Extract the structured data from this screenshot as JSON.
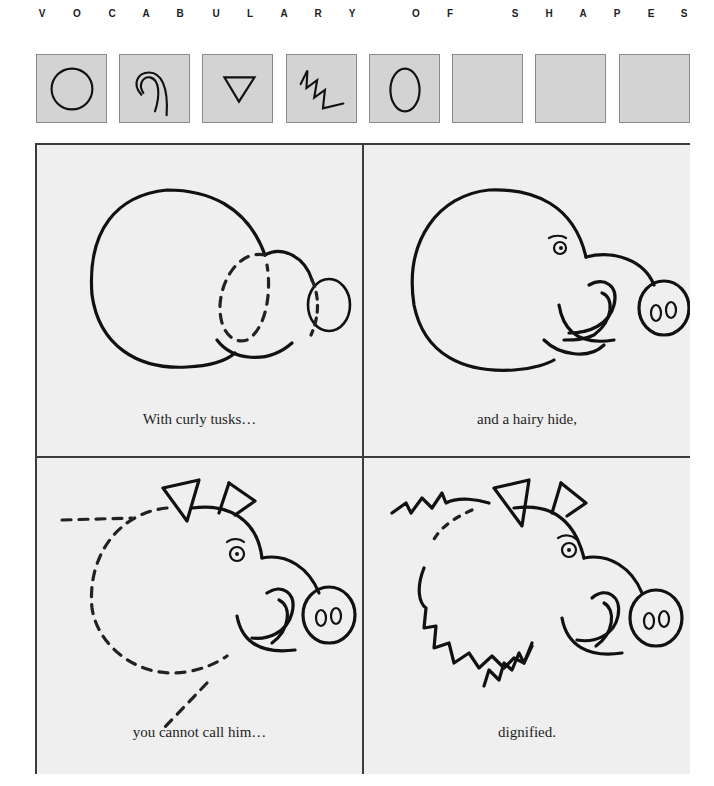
{
  "header": {
    "letters": [
      {
        "ch": "V",
        "x": 42
      },
      {
        "ch": "O",
        "x": 77
      },
      {
        "ch": "C",
        "x": 112
      },
      {
        "ch": "A",
        "x": 146
      },
      {
        "ch": "B",
        "x": 180
      },
      {
        "ch": "U",
        "x": 216
      },
      {
        "ch": "L",
        "x": 250
      },
      {
        "ch": "A",
        "x": 284
      },
      {
        "ch": "R",
        "x": 318
      },
      {
        "ch": "Y",
        "x": 352
      },
      {
        "ch": "O",
        "x": 416
      },
      {
        "ch": "F",
        "x": 450
      },
      {
        "ch": "S",
        "x": 515
      },
      {
        "ch": "H",
        "x": 549
      },
      {
        "ch": "A",
        "x": 583
      },
      {
        "ch": "P",
        "x": 617
      },
      {
        "ch": "E",
        "x": 651
      },
      {
        "ch": "S",
        "x": 684
      }
    ]
  },
  "shape_boxes": [
    {
      "shape": "circle",
      "x": 36
    },
    {
      "shape": "spiral",
      "x": 119
    },
    {
      "shape": "triangle",
      "x": 202
    },
    {
      "shape": "zigzag",
      "x": 286
    },
    {
      "shape": "oval",
      "x": 369
    },
    {
      "shape": "empty",
      "x": 452
    },
    {
      "shape": "empty",
      "x": 535
    },
    {
      "shape": "empty",
      "x": 619
    }
  ],
  "panels": [
    {
      "id": "step-1",
      "caption": "With curly tusks…"
    },
    {
      "id": "step-2",
      "caption": "and a hairy hide,"
    },
    {
      "id": "step-3",
      "caption": "you cannot call him…"
    },
    {
      "id": "step-4",
      "caption": "dignified."
    }
  ],
  "colors": {
    "box_fill": "#d3d3d3",
    "panel_fill": "#efefef",
    "ink": "#111111",
    "border": "#3c3c3c"
  }
}
